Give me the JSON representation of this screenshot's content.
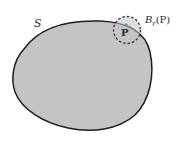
{
  "diagram": {
    "region_label": "S",
    "ball_label": {
      "symbol": "B",
      "subscript": "r",
      "argument": "(P)"
    },
    "point_label": "P",
    "colors": {
      "region_fill": "#c4c4c4",
      "region_stroke": "#1e1e1e",
      "ball_stroke": "#333333",
      "point_color": "#5a9fd4"
    }
  }
}
